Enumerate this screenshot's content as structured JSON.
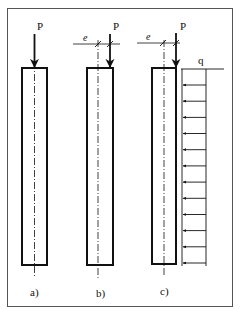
{
  "figure": {
    "colors": {
      "stroke": "#111111",
      "frame": "#555555",
      "background": "#ffffff"
    },
    "columns": [
      {
        "id": "a",
        "label": "a)",
        "load_label": "P",
        "eccentricity_label": ""
      },
      {
        "id": "b",
        "label": "b)",
        "load_label": "P",
        "eccentricity_label": "e"
      },
      {
        "id": "c",
        "label": "c)",
        "load_label": "P",
        "eccentricity_label": "e",
        "distributed_load_label": "q",
        "distributed_arrows": 12
      }
    ]
  }
}
